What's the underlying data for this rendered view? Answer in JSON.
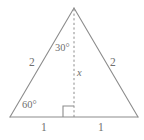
{
  "figure": {
    "type": "geometry-diagram",
    "shape": "triangle",
    "stroke_color": "#8c8c8c",
    "text_color": "#6f6f6f",
    "background_color": "#ffffff",
    "geometry": {
      "apex": [
        74,
        8
      ],
      "base_left": [
        10,
        117
      ],
      "base_right": [
        138,
        117
      ],
      "altitude_foot": [
        74,
        117
      ]
    },
    "labels": {
      "apex_angle": "30°",
      "left_side": "2",
      "right_side": "2",
      "base_left_angle": "60°",
      "altitude": "x",
      "base_left_segment": "1",
      "base_right_segment": "1"
    },
    "markers": {
      "right_angle": "right-angle-square",
      "altitude_style": "dashed"
    }
  }
}
